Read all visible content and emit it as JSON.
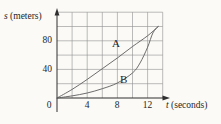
{
  "figure": {
    "background": "#fbfaf7",
    "grid_color": "#8f8f8f",
    "axis_color": "#2f2f2f",
    "curve_color": "#5c5c5c",
    "text_color": "#262626"
  },
  "labels": {
    "y_var": "s",
    "y_unit": " (meters)",
    "x_var": "t",
    "x_unit": " (seconds)",
    "curve_a": "A",
    "curve_b": "B"
  },
  "ticks": {
    "x": [
      "0",
      "4",
      "8",
      "12"
    ],
    "y": [
      "40",
      "80"
    ]
  },
  "chart_data": {
    "type": "line",
    "title": "",
    "xlabel": "t (seconds)",
    "ylabel": "s (meters)",
    "xlim": [
      0,
      14
    ],
    "ylim": [
      0,
      120
    ],
    "x_tick_values": [
      0,
      4,
      8,
      12
    ],
    "y_tick_values": [
      40,
      80
    ],
    "x_grid_step": 2,
    "y_grid_step": 20,
    "grid": true,
    "annotations": [
      {
        "text": "A",
        "t": 7.8,
        "s": 78
      },
      {
        "text": "B",
        "t": 8.9,
        "s": 27
      }
    ],
    "series": [
      {
        "name": "A",
        "x": [
          0,
          2,
          4,
          6,
          8,
          10,
          12,
          13.4
        ],
        "y": [
          0,
          12,
          26,
          41,
          56,
          72,
          87,
          100
        ]
      },
      {
        "name": "B",
        "x": [
          0,
          2,
          4,
          6,
          8,
          10,
          11,
          12,
          12.7,
          13.4
        ],
        "y": [
          0,
          3,
          7,
          13,
          21,
          35,
          49,
          71,
          91,
          100
        ]
      }
    ]
  }
}
